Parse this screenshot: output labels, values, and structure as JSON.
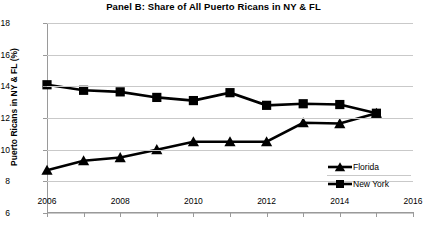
{
  "chart_data": {
    "type": "line",
    "title": "Panel B: Share of All Puerto Ricans in NY & FL",
    "xlabel": "",
    "ylabel": "Puerto Ricans in NY & FL (%)",
    "x": [
      2006,
      2007,
      2008,
      2009,
      2010,
      2011,
      2012,
      2013,
      2014,
      2015
    ],
    "xlim": [
      2006,
      2016
    ],
    "ylim": [
      6,
      18
    ],
    "xticks": [
      2006,
      2008,
      2010,
      2012,
      2014,
      2016
    ],
    "xtick_labels": [
      "2006",
      "2008",
      "2010",
      "2012",
      "2014",
      "2016"
    ],
    "xminor_ticks": [
      2007,
      2009,
      2011,
      2013,
      2015
    ],
    "yticks": [
      6,
      8,
      10,
      12,
      14,
      16,
      18
    ],
    "ytick_labels": [
      "6",
      "8",
      "10",
      "12",
      "14",
      "16",
      "18"
    ],
    "grid": true,
    "legend_position": "bottom-right",
    "series": [
      {
        "name": "Florida",
        "marker": "triangle",
        "color": "#000000",
        "values": [
          8.7,
          9.3,
          9.5,
          10.0,
          10.5,
          10.5,
          10.5,
          11.7,
          11.65,
          12.3
        ]
      },
      {
        "name": "New York",
        "marker": "square",
        "color": "#000000",
        "values": [
          14.1,
          13.75,
          13.65,
          13.3,
          13.1,
          13.6,
          12.8,
          12.9,
          12.85,
          12.3
        ]
      }
    ]
  },
  "legend": {
    "items": [
      {
        "label": "Florida"
      },
      {
        "label": "New York"
      }
    ]
  }
}
